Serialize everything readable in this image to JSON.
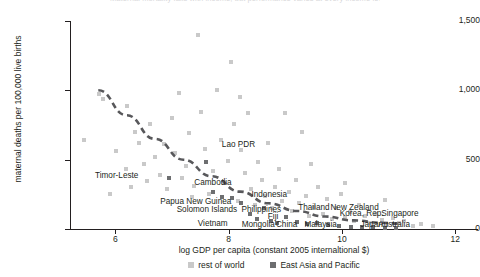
{
  "figure": {
    "clipped_title": "Maternal mortality falls with income, but performance varies at every income level",
    "colors": {
      "rest_of_world": "#c9c9c9",
      "east_asia_pacific": "#6d6e70",
      "trend_line": "#58585b",
      "axis": "#231f20"
    }
  },
  "legend": {
    "position": "bottom-center",
    "entries": [
      {
        "label": "rest of world",
        "swatch": "rest"
      },
      {
        "label": "East Asia and Pacific",
        "swatch": "eap"
      }
    ]
  },
  "axes": {
    "y_title": "maternal deaths per 100,000 live births",
    "x_title": "log GDP per capita (constant 2005 internaltional $)",
    "y_ticks": [
      "0",
      "500",
      "1,000",
      "1,500"
    ],
    "x_ticks": [
      "6",
      "8",
      "10",
      "12"
    ]
  },
  "chart_data": {
    "type": "scatter",
    "title": "Maternal mortality falls with income, but performance varies at every income level",
    "xlabel": "log GDP per capita (constant 2005 internaltional $)",
    "ylabel": "maternal deaths per 100,000 live births",
    "xlim": [
      5.2,
      12.4
    ],
    "ylim": [
      0,
      1500
    ],
    "x_ticks": [
      6,
      8,
      10,
      12
    ],
    "y_ticks": [
      0,
      500,
      1000,
      1500
    ],
    "grid": false,
    "legend_position": "bottom-center",
    "series": [
      {
        "name": "rest of world",
        "color": "#c9c9c9",
        "marker": "square",
        "points": [
          [
            5.45,
            640
          ],
          [
            5.72,
            975
          ],
          [
            5.78,
            940
          ],
          [
            5.9,
            250
          ],
          [
            6.02,
            560
          ],
          [
            6.18,
            430
          ],
          [
            6.28,
            300
          ],
          [
            6.35,
            700
          ],
          [
            6.42,
            620
          ],
          [
            6.5,
            470
          ],
          [
            6.55,
            345
          ],
          [
            6.62,
            760
          ],
          [
            6.7,
            520
          ],
          [
            6.78,
            390
          ],
          [
            6.86,
            610
          ],
          [
            6.92,
            285
          ],
          [
            7.0,
            800
          ],
          [
            7.05,
            545
          ],
          [
            7.12,
            980
          ],
          [
            7.18,
            365
          ],
          [
            7.25,
            455
          ],
          [
            7.3,
            690
          ],
          [
            7.38,
            310
          ],
          [
            7.45,
            1400
          ],
          [
            7.52,
            845
          ],
          [
            7.58,
            580
          ],
          [
            7.65,
            255
          ],
          [
            7.72,
            420
          ],
          [
            7.8,
            1000
          ],
          [
            7.86,
            640
          ],
          [
            7.92,
            330
          ],
          [
            7.98,
            490
          ],
          [
            8.04,
            1205
          ],
          [
            8.1,
            760
          ],
          [
            8.16,
            205
          ],
          [
            8.22,
            570
          ],
          [
            8.28,
            405
          ],
          [
            8.34,
            835
          ],
          [
            8.4,
            290
          ],
          [
            8.46,
            175
          ],
          [
            8.52,
            480
          ],
          [
            8.58,
            355
          ],
          [
            8.64,
            240
          ],
          [
            8.7,
            620
          ],
          [
            8.76,
            150
          ],
          [
            8.82,
            305
          ],
          [
            8.88,
            430
          ],
          [
            8.94,
            200
          ],
          [
            9.0,
            840
          ],
          [
            9.06,
            265
          ],
          [
            9.12,
            130
          ],
          [
            9.18,
            355
          ],
          [
            9.24,
            185
          ],
          [
            9.3,
            700
          ],
          [
            9.36,
            240
          ],
          [
            9.42,
            95
          ],
          [
            9.5,
            160
          ],
          [
            9.58,
            300
          ],
          [
            9.66,
            110
          ],
          [
            9.74,
            215
          ],
          [
            9.82,
            70
          ],
          [
            9.9,
            150
          ],
          [
            9.98,
            255
          ],
          [
            10.06,
            85
          ],
          [
            10.14,
            120
          ],
          [
            10.22,
            60
          ],
          [
            10.3,
            175
          ],
          [
            10.4,
            95
          ],
          [
            10.5,
            45
          ],
          [
            10.6,
            110
          ],
          [
            10.7,
            65
          ],
          [
            10.8,
            30
          ],
          [
            10.9,
            80
          ],
          [
            11.0,
            40
          ],
          [
            11.1,
            55
          ],
          [
            11.25,
            25
          ],
          [
            11.4,
            35
          ],
          [
            11.6,
            20
          ],
          [
            6.2,
            890
          ],
          [
            7.35,
            230
          ],
          [
            8.2,
            955
          ],
          [
            9.45,
            470
          ],
          [
            10.05,
            330
          ],
          [
            10.75,
            210
          ]
        ]
      },
      {
        "name": "East Asia and Pacific",
        "color": "#6d6e70",
        "marker": "square",
        "points": [
          [
            6.95,
            370
          ],
          [
            7.6,
            480
          ],
          [
            7.72,
            265
          ],
          [
            7.88,
            230
          ],
          [
            8.05,
            220
          ],
          [
            8.22,
            185
          ],
          [
            8.38,
            105
          ],
          [
            8.5,
            75
          ],
          [
            8.62,
            155
          ],
          [
            8.74,
            60
          ],
          [
            8.86,
            45
          ],
          [
            9.02,
            90
          ],
          [
            9.2,
            50
          ],
          [
            9.38,
            35
          ],
          [
            9.55,
            40
          ],
          [
            9.75,
            28
          ],
          [
            9.95,
            22
          ],
          [
            10.15,
            18
          ],
          [
            10.35,
            12
          ],
          [
            10.55,
            15
          ],
          [
            10.75,
            10
          ],
          [
            10.95,
            8
          ]
        ]
      }
    ],
    "trend_line": {
      "style": "dashed",
      "color": "#58585b",
      "points": [
        [
          5.7,
          1000
        ],
        [
          6.2,
          820
        ],
        [
          6.7,
          650
        ],
        [
          7.2,
          500
        ],
        [
          7.7,
          380
        ],
        [
          8.2,
          270
        ],
        [
          8.7,
          185
        ],
        [
          9.2,
          130
        ],
        [
          9.7,
          90
        ],
        [
          10.2,
          62
        ],
        [
          10.7,
          45
        ],
        [
          11.0,
          38
        ]
      ]
    },
    "annotations": [
      {
        "text": "Timor-Leste",
        "x": 6.4,
        "y": 385,
        "anchor": "right"
      },
      {
        "text": "Lao PDR",
        "x": 7.88,
        "y": 605,
        "anchor": "left"
      },
      {
        "text": "Cambodia",
        "x": 7.72,
        "y": 330,
        "anchor": "center"
      },
      {
        "text": "Papua New Guinea",
        "x": 7.42,
        "y": 195,
        "anchor": "center"
      },
      {
        "text": "Solomon Islands",
        "x": 7.62,
        "y": 140,
        "anchor": "center"
      },
      {
        "text": "Vietnam",
        "x": 7.72,
        "y": 35,
        "anchor": "center"
      },
      {
        "text": "Indonesia",
        "x": 8.72,
        "y": 245,
        "anchor": "center"
      },
      {
        "text": "Philippines",
        "x": 8.58,
        "y": 140,
        "anchor": "center"
      },
      {
        "text": "Fiji",
        "x": 8.78,
        "y": 85,
        "anchor": "center"
      },
      {
        "text": "Mongolia",
        "x": 8.52,
        "y": 30,
        "anchor": "center"
      },
      {
        "text": "China",
        "x": 9.02,
        "y": 30,
        "anchor": "center"
      },
      {
        "text": "Thailand",
        "x": 9.5,
        "y": 150,
        "anchor": "center"
      },
      {
        "text": "Malaysia",
        "x": 9.62,
        "y": 30,
        "anchor": "center"
      },
      {
        "text": "New Zealand",
        "x": 10.22,
        "y": 150,
        "anchor": "center"
      },
      {
        "text": "Korea, Rep.",
        "x": 10.35,
        "y": 105,
        "anchor": "center"
      },
      {
        "text": "Japan",
        "x": 10.52,
        "y": 30,
        "anchor": "center"
      },
      {
        "text": "Australia",
        "x": 10.92,
        "y": 30,
        "anchor": "center"
      },
      {
        "text": "Singapore",
        "x": 11.02,
        "y": 105,
        "anchor": "center"
      }
    ]
  }
}
